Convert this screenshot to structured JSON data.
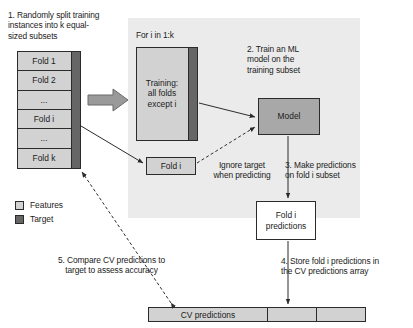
{
  "diagram": {
    "loop_label": "For i in 1:k",
    "steps": {
      "step1": "1. Randomly split training\n    instances into k equal-\n    sized subsets",
      "step2": "2. Train an ML\n    model on the\n    training subset",
      "step3": "3. Make predictions\n    on fold i subset",
      "step4": "4. Store fold i predictions in\n    the CV predictions array",
      "step5": "5. Compare CV predictions to\ntarget to assess accuracy",
      "ignore_note": "Ignore target\nwhen predicting"
    },
    "folds": [
      {
        "label": "Fold 1"
      },
      {
        "label": "Fold 2"
      },
      {
        "label": "..."
      },
      {
        "label": "Fold i"
      },
      {
        "label": "..."
      },
      {
        "label": "Fold k"
      }
    ],
    "boxes": {
      "training": "Training:\nall folds\nexcept i",
      "fold_i": "Fold i",
      "model": "Model",
      "fold_i_predictions": "Fold i\npredictions"
    },
    "cv_array": {
      "cells": [
        {
          "label": "CV predictions"
        },
        {
          "label": ""
        },
        {
          "label": ""
        }
      ]
    },
    "legend": [
      {
        "label": "Features",
        "color": "#d2d2d2"
      },
      {
        "label": "Target",
        "color": "#666666"
      }
    ],
    "colors": {
      "features": "#d2d2d2",
      "target": "#666666",
      "model": "#a8a8a8",
      "panel": "#ebebeb",
      "stroke": "#2b2b2b",
      "background": "#ffffff"
    }
  }
}
